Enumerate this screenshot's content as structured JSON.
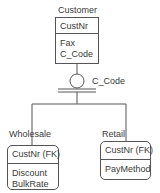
{
  "diagram": {
    "type": "IDEF1X category (subtype) diagram",
    "parent": {
      "name": "Customer",
      "key_attributes": [
        "CustNr"
      ],
      "non_key_attributes": [
        "Fax",
        "C_Code"
      ]
    },
    "discriminator": {
      "label": "C_Code",
      "symbol": "complete-category-circle"
    },
    "children": [
      {
        "name": "Wholesale",
        "key_attributes": [
          "CustNr (FK)"
        ],
        "non_key_attributes": [
          "Discount",
          "BulkRate"
        ]
      },
      {
        "name": "Retail",
        "key_attributes": [
          "CustNr (FK)"
        ],
        "non_key_attributes": [
          "PayMethod"
        ]
      }
    ]
  },
  "colors": {
    "line": "#555555",
    "text": "#3a3a3a",
    "background": "#ffffff"
  }
}
